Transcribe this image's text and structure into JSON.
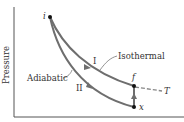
{
  "diagram": {
    "axis_label_y": "Pressure",
    "curves": {
      "isothermal_label": "Isothermal",
      "adiabatic_label": "Adiabatic",
      "path_I_label": "I",
      "path_II_label": "II"
    },
    "points": {
      "initial": "i",
      "final": "f",
      "intermediate": "x"
    },
    "isotherm_label": "T",
    "colors": {
      "curve": "#6e6e6e",
      "axis": "#444444",
      "point": "#111111",
      "text": "#333333"
    }
  }
}
